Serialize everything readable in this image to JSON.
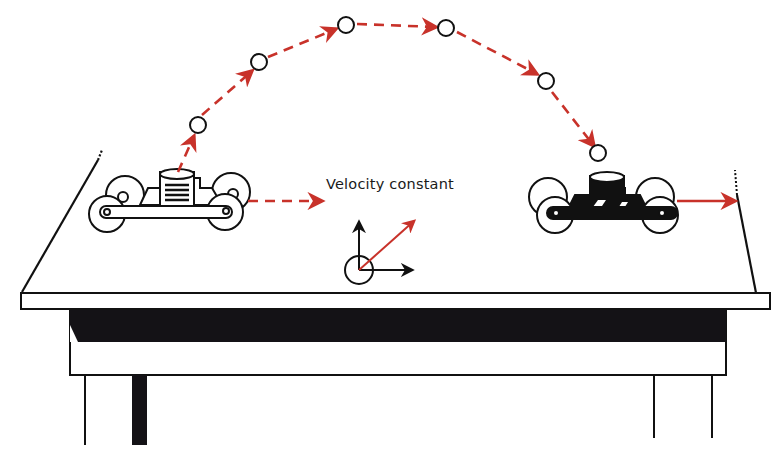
{
  "figure": {
    "label": "Velocity constant",
    "colors": {
      "trajectory": "#c8322a",
      "ink": "#111111",
      "background": "#ffffff"
    },
    "ball_positions": [
      [
        198,
        125
      ],
      [
        259,
        62
      ],
      [
        346,
        25
      ],
      [
        446,
        28
      ],
      [
        546,
        81
      ],
      [
        598,
        153
      ]
    ],
    "elements": [
      "cart-left",
      "cart-right",
      "ball-trajectory",
      "velocity-vector-diagram",
      "table"
    ]
  }
}
